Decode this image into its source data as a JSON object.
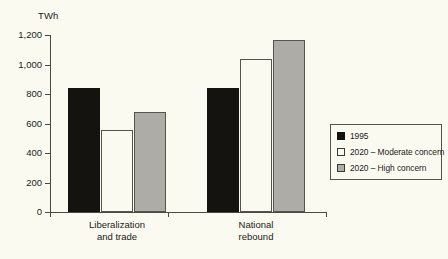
{
  "chart_data": {
    "type": "bar",
    "title": "",
    "subtitle": "",
    "xlabel": "",
    "ylabel": "TWh",
    "unit_label": "TWh",
    "ylim": [
      0,
      1200
    ],
    "yticks": [
      0,
      200,
      400,
      600,
      800,
      1000,
      1200
    ],
    "ytick_labels": [
      "0",
      "200",
      "400",
      "600",
      "800",
      "1,000",
      "1,200"
    ],
    "grid": false,
    "legend_position": "right-middle",
    "categories": [
      "Liberalization and trade",
      "National rebound"
    ],
    "category_lines": [
      [
        "Liberalization",
        "and trade"
      ],
      [
        "National",
        "rebound"
      ]
    ],
    "series": [
      {
        "name": "1995",
        "color": "#151310",
        "values": [
          840,
          840
        ]
      },
      {
        "name": "2020 – Moderate concern",
        "color": "#fbfaf0",
        "values": [
          555,
          1040
        ]
      },
      {
        "name": "2020 – High concern",
        "color": "#adaca6",
        "values": [
          680,
          1165
        ]
      }
    ],
    "legend_entries": [
      {
        "label": "1995",
        "swatch": "s1995"
      },
      {
        "label": "2020 – Moderate concern",
        "swatch": "moderate"
      },
      {
        "label": "2020 – High concern",
        "swatch": "high"
      }
    ]
  },
  "colors": {
    "background": "#fbfaf0",
    "axis": "#4a4a45",
    "series_1995": "#151310",
    "series_moderate": "#fbfaf0",
    "series_high": "#adaca6",
    "outline": "#55554e"
  }
}
